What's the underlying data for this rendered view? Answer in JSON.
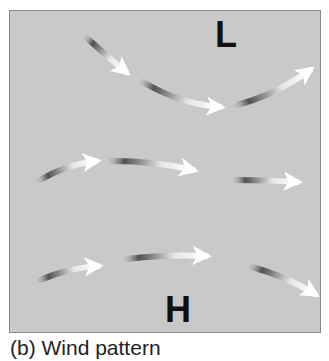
{
  "figure": {
    "caption": "(b) Wind pattern",
    "background_color": "#c9c9c9",
    "border_color": "#8a8a8a"
  },
  "labels": {
    "low": "L",
    "high": "H"
  },
  "arrows": [
    {
      "id": "arrow-1",
      "path": "M87,38 Q105,55 126,72"
    },
    {
      "id": "arrow-2",
      "path": "M143,82 Q180,104 220,107"
    },
    {
      "id": "arrow-3",
      "path": "M237,105 Q275,95 310,70"
    },
    {
      "id": "arrow-4",
      "path": "M40,180 Q65,165 96,161"
    },
    {
      "id": "arrow-5",
      "path": "M112,161 Q155,161 193,170"
    },
    {
      "id": "arrow-6",
      "path": "M236,180 Q265,180 297,182"
    },
    {
      "id": "arrow-7",
      "path": "M40,280 Q68,268 98,266"
    },
    {
      "id": "arrow-8",
      "path": "M127,259 Q165,254 206,256"
    },
    {
      "id": "arrow-9",
      "path": "M252,267 Q285,276 315,294"
    }
  ]
}
